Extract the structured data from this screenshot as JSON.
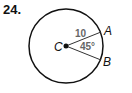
{
  "problem": {
    "number": "24."
  },
  "diagram": {
    "center_label": "C",
    "point_a_label": "A",
    "point_b_label": "B",
    "radius_label": "10",
    "angle_label": "45°",
    "colors": {
      "stroke": "#111111",
      "label_gray": "#666666"
    }
  }
}
